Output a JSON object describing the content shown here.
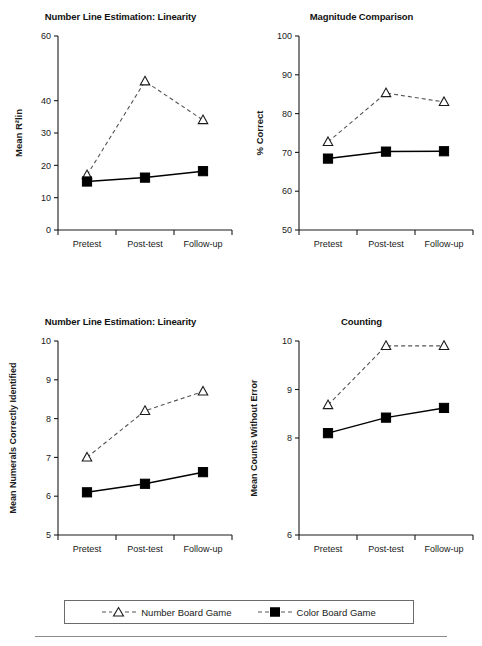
{
  "figure": {
    "background": "#ffffff",
    "line_color": "#1a1a1a",
    "dashed_series_color": "#555555",
    "solid_series_color": "#000000"
  },
  "legend": {
    "entries": [
      {
        "label": "Number Board Game",
        "marker": "open-triangle-icon",
        "line": "dashed"
      },
      {
        "label": "Color Board Game",
        "marker": "filled-square-icon",
        "line": "dashed"
      }
    ]
  },
  "chart_data": [
    {
      "id": "number-line-estimation-linearity",
      "type": "line",
      "title": "Number Line Estimation: Linearity",
      "xlabel": "",
      "ylabel": "Mean R²lin",
      "categories": [
        "Pretest",
        "Post-test",
        "Follow-up"
      ],
      "ylim": [
        0,
        60
      ],
      "yticks": [
        0,
        10,
        20,
        30,
        40,
        60
      ],
      "yticklabels": [
        "0",
        "10",
        "20",
        "30",
        "40",
        "60"
      ],
      "grid": false,
      "legend_position": "bottom",
      "series": [
        {
          "name": "Number Board Game",
          "marker": "triangle",
          "line": "dashed",
          "values": [
            17,
            46,
            34
          ]
        },
        {
          "name": "Color Board Game",
          "marker": "square",
          "line": "solid",
          "values": [
            15,
            16.2,
            18.2
          ]
        }
      ]
    },
    {
      "id": "magnitude-comparison",
      "type": "line",
      "title": "Magnitude Comparison",
      "xlabel": "",
      "ylabel": "% Correct",
      "categories": [
        "Pretest",
        "Post-test",
        "Follow-up"
      ],
      "ylim": [
        50,
        100
      ],
      "yticks": [
        50,
        60,
        70,
        80,
        90,
        100
      ],
      "yticklabels": [
        "50",
        "60",
        "70",
        "80",
        "90",
        "100"
      ],
      "grid": false,
      "legend_position": "bottom",
      "series": [
        {
          "name": "Number Board Game",
          "marker": "triangle",
          "line": "dashed",
          "values": [
            72.7,
            85.3,
            83.0
          ]
        },
        {
          "name": "Color Board Game",
          "marker": "square",
          "line": "solid",
          "values": [
            68.4,
            70.2,
            70.3
          ]
        }
      ]
    },
    {
      "id": "numerals-correctly-identified",
      "type": "line",
      "title": "Number Line Estimation: Linearity",
      "xlabel": "",
      "ylabel": "Mean Numerals Correctly Identified",
      "categories": [
        "Pretest",
        "Post-test",
        "Follow-up"
      ],
      "ylim": [
        5,
        10
      ],
      "yticks": [
        5,
        6,
        7,
        8,
        9,
        10
      ],
      "yticklabels": [
        "5",
        "6",
        "7",
        "8",
        "9",
        "10"
      ],
      "grid": false,
      "legend_position": "bottom",
      "series": [
        {
          "name": "Number Board Game",
          "marker": "triangle",
          "line": "dashed",
          "values": [
            7.0,
            8.2,
            8.7
          ]
        },
        {
          "name": "Color Board Game",
          "marker": "square",
          "line": "solid",
          "values": [
            6.1,
            6.32,
            6.62
          ]
        }
      ]
    },
    {
      "id": "counting",
      "type": "line",
      "title": "Counting",
      "xlabel": "",
      "ylabel": "Mean Counts Without Error",
      "categories": [
        "Pretest",
        "Post-test",
        "Follow-up"
      ],
      "ylim": [
        6,
        10
      ],
      "yticks": [
        6,
        8,
        9,
        10
      ],
      "yticklabels": [
        "6",
        "8",
        "9",
        "10"
      ],
      "grid": false,
      "legend_position": "bottom",
      "series": [
        {
          "name": "Number Board Game",
          "marker": "triangle",
          "line": "dashed",
          "values": [
            8.68,
            9.9,
            9.9
          ]
        },
        {
          "name": "Color Board Game",
          "marker": "square",
          "line": "solid",
          "values": [
            8.1,
            8.42,
            8.62
          ]
        }
      ]
    }
  ]
}
